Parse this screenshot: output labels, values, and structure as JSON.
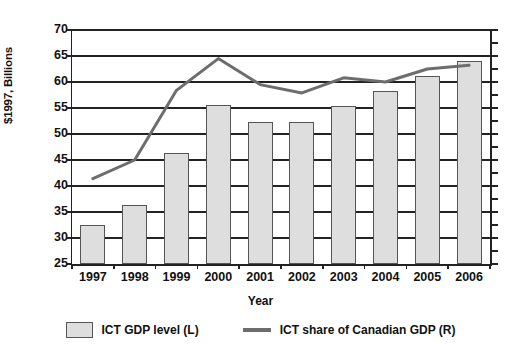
{
  "chart_data": {
    "type": "bar",
    "title": "",
    "xlabel": "Year",
    "ylabel": "$1997, Billions",
    "categories": [
      "1997",
      "1998",
      "1999",
      "2000",
      "2001",
      "2002",
      "2003",
      "2004",
      "2005",
      "2006"
    ],
    "ylim": [
      25,
      70
    ],
    "yticks": [
      25,
      30,
      35,
      40,
      45,
      50,
      55,
      60,
      65,
      70
    ],
    "grid": true,
    "legend_position": "bottom",
    "series": [
      {
        "name": "ICT GDP level (L)",
        "type": "bar",
        "axis": "left",
        "color": "#dedede",
        "values": [
          32.5,
          36.4,
          46.4,
          55.6,
          52.4,
          52.3,
          55.4,
          58.3,
          61.2,
          64.0
        ]
      },
      {
        "name": "ICT share of Canadian GDP (R)",
        "type": "line",
        "axis": "right",
        "color": "#6d6d6d",
        "values": [
          41.4,
          45.0,
          58.4,
          64.5,
          59.5,
          57.9,
          60.8,
          60.0,
          62.5,
          63.2
        ]
      }
    ]
  },
  "axis": {
    "y_label": "$1997, Billions",
    "x_label": "Year",
    "y_ticks": [
      "70",
      "65",
      "60",
      "55",
      "50",
      "45",
      "40",
      "35",
      "30",
      "25"
    ],
    "x_ticks": [
      "1997",
      "1998",
      "1999",
      "2000",
      "2001",
      "2002",
      "2003",
      "2004",
      "2005",
      "2006"
    ]
  },
  "legend": {
    "items": [
      {
        "label": "ICT GDP level (L)",
        "marker": "bar-swatch",
        "color": "#dedede"
      },
      {
        "label": "ICT share of Canadian GDP (R)",
        "marker": "line-swatch",
        "color": "#6d6d6d"
      }
    ]
  },
  "colors": {
    "bar_fill": "#dedede",
    "bar_stroke": "#555555",
    "line": "#6d6d6d",
    "axis": "#222222",
    "text": "#111111",
    "background": "#ffffff"
  }
}
